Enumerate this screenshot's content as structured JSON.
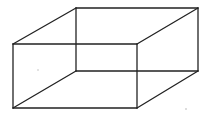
{
  "figure": {
    "stroke_color": "#222222",
    "background_color": "#ffffff",
    "vertices": {
      "front_top_left": [
        13,
        44
      ],
      "front_top_right": [
        137,
        44
      ],
      "front_bottom_left": [
        13,
        108
      ],
      "front_bottom_right": [
        137,
        108
      ],
      "back_top_left": [
        76,
        8
      ],
      "back_top_right": [
        198,
        8
      ],
      "back_bottom_left": [
        76,
        71
      ],
      "back_bottom_right": [
        198,
        71
      ]
    },
    "edges": [
      [
        "front_top_left",
        "front_top_right"
      ],
      [
        "front_top_right",
        "front_bottom_right"
      ],
      [
        "front_bottom_right",
        "front_bottom_left"
      ],
      [
        "front_bottom_left",
        "front_top_left"
      ],
      [
        "back_top_left",
        "back_top_right"
      ],
      [
        "back_top_right",
        "back_bottom_right"
      ],
      [
        "back_bottom_right",
        "back_bottom_left"
      ],
      [
        "back_bottom_left",
        "back_top_left"
      ],
      [
        "front_top_left",
        "back_top_left"
      ],
      [
        "front_top_right",
        "back_top_right"
      ],
      [
        "front_bottom_left",
        "back_bottom_left"
      ],
      [
        "front_bottom_right",
        "back_bottom_right"
      ]
    ],
    "artifacts": [
      {
        "x": 38,
        "y": 70,
        "r": 0.7
      },
      {
        "x": 186,
        "y": 109,
        "r": 0.8
      }
    ]
  }
}
